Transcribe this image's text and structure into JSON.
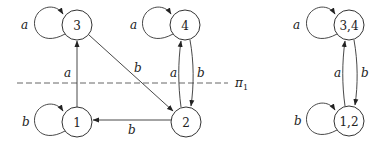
{
  "diagram": {
    "left_automaton": {
      "states": [
        {
          "id": "3",
          "label": "3"
        },
        {
          "id": "4",
          "label": "4"
        },
        {
          "id": "1",
          "label": "1"
        },
        {
          "id": "2",
          "label": "2"
        }
      ],
      "transitions": [
        {
          "from": "3",
          "to": "3",
          "label": "a"
        },
        {
          "from": "4",
          "to": "4",
          "label": "a"
        },
        {
          "from": "1",
          "to": "1",
          "label": "b"
        },
        {
          "from": "1",
          "to": "3",
          "label": "a"
        },
        {
          "from": "3",
          "to": "2",
          "label": "b"
        },
        {
          "from": "2",
          "to": "4",
          "label": "a"
        },
        {
          "from": "4",
          "to": "2",
          "label": "b"
        },
        {
          "from": "2",
          "to": "1",
          "label": "b"
        }
      ],
      "partition_line_label": "π",
      "partition_line_subscript": "1"
    },
    "right_automaton": {
      "states": [
        {
          "id": "34",
          "label": "3,4"
        },
        {
          "id": "12",
          "label": "1,2"
        }
      ],
      "transitions": [
        {
          "from": "34",
          "to": "34",
          "label": "a"
        },
        {
          "from": "12",
          "to": "12",
          "label": "b"
        },
        {
          "from": "12",
          "to": "34",
          "label": "a"
        },
        {
          "from": "34",
          "to": "12",
          "label": "b"
        }
      ]
    }
  }
}
